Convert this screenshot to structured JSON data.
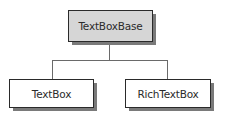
{
  "diagram": {
    "type": "class-hierarchy",
    "colors": {
      "parent_fill": "#d6d6d6",
      "child_fill": "#ffffff",
      "border": "#2a2a2a",
      "shadow": "#7a7a7a",
      "connector": "#6a6a6a"
    },
    "nodes": [
      {
        "id": "parent",
        "label": "TextBoxBase",
        "role": "base-class"
      },
      {
        "id": "child1",
        "label": "TextBox",
        "role": "derived-class"
      },
      {
        "id": "child2",
        "label": "RichTextBox",
        "role": "derived-class"
      }
    ],
    "edges": [
      {
        "from": "parent",
        "to": "child1"
      },
      {
        "from": "parent",
        "to": "child2"
      }
    ]
  }
}
